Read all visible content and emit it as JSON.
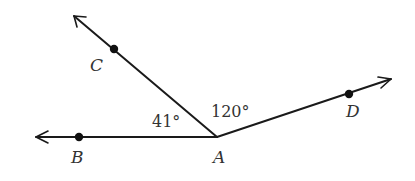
{
  "diagram": {
    "type": "angle-figure",
    "vertex": {
      "label": "A",
      "x": 217,
      "y": 137,
      "label_x": 213,
      "label_y": 163
    },
    "rays": [
      {
        "name": "ray-AB",
        "to_point": "B",
        "tip": {
          "x": 35,
          "y": 137
        }
      },
      {
        "name": "ray-AC",
        "to_point": "C",
        "tip": {
          "x": 73,
          "y": 15
        }
      },
      {
        "name": "ray-AD",
        "to_point": "D",
        "tip": {
          "x": 392,
          "y": 79
        }
      }
    ],
    "points": [
      {
        "label": "B",
        "x": 79,
        "y": 137,
        "label_x": 71,
        "label_y": 163
      },
      {
        "label": "C",
        "x": 114,
        "y": 49,
        "label_x": 90,
        "label_y": 71
      },
      {
        "label": "D",
        "x": 349,
        "y": 94,
        "label_x": 346,
        "label_y": 117
      }
    ],
    "angles": [
      {
        "name": "angle-BAC",
        "value": "41°",
        "x": 152,
        "y": 127
      },
      {
        "name": "angle-CAD",
        "value": "120°",
        "x": 211,
        "y": 117
      }
    ],
    "colors": {
      "line": "#1a1a1a",
      "text": "#333333",
      "background": "#ffffff"
    }
  },
  "labels": {
    "A": "A",
    "B": "B",
    "C": "C",
    "D": "D",
    "angle_BAC": "41°",
    "angle_CAD": "120°"
  }
}
